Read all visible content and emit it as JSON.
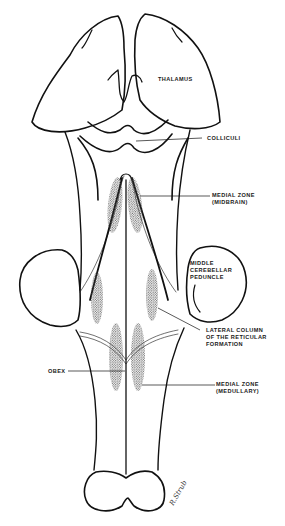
{
  "figure": {
    "labels": {
      "thalamus": "THALAMUS",
      "colliculi": "COLLICULI",
      "medial_zone_midbrain_1": "MEDIAL ZONE",
      "medial_zone_midbrain_2": "(MIDBRAIN)",
      "middle_cerebellar_1": "MIDDLE",
      "middle_cerebellar_2": "CEREBELLAR",
      "middle_cerebellar_3": "PEDUNCLE",
      "lateral_column_1": "LATERAL COLUMN",
      "lateral_column_2": "OF THE RETICULAR",
      "lateral_column_3": "FORMATION",
      "obex": "OBEX",
      "medial_zone_medullary_1": "MEDIAL ZONE",
      "medial_zone_medullary_2": "(MEDULLARY)"
    },
    "signature": "R.Strub",
    "colors": {
      "line": "#111111",
      "stipple": "#555555",
      "background": "#ffffff"
    }
  }
}
